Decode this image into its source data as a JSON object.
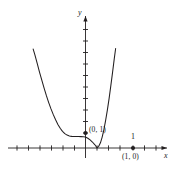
{
  "figure": {
    "kind": "cartesian-graph",
    "background": "#ffffff",
    "stroke_color": "#231f20",
    "curve_color": "#231f20"
  },
  "axes": {
    "x_label": "x",
    "y_label": "y",
    "origin_px": [
      85.5,
      148
    ],
    "x_axis_y_px": 148,
    "y_axis_x_px": 85.5,
    "tick_spacing_px": 11.5,
    "x_ticks_left": 7,
    "x_ticks_right": 7,
    "y_ticks_up": 11,
    "y_ticks_down": 1,
    "arrow_ends": [
      "x-right",
      "y-top"
    ]
  },
  "labels": {
    "point_0_1": "(0, 1)",
    "point_1_0": "(1, 0)",
    "tick_one": "1"
  },
  "points": [
    {
      "name": "y-intercept",
      "label": "(0, 1)",
      "x": 0,
      "y": 1,
      "px": [
        85.5,
        133
      ],
      "marker": "filled-dot"
    },
    {
      "name": "x-intercept",
      "label": "(1, 0)",
      "x": 1,
      "y": 0,
      "px": [
        133,
        148
      ],
      "marker": "filled-dot"
    }
  ],
  "chart_data": {
    "type": "line",
    "title": "",
    "xlabel": "x",
    "ylabel": "y",
    "grid": false,
    "legend": null,
    "xlim": [
      -4.4,
      7.7
    ],
    "ylim": [
      -1.0,
      8.7
    ],
    "annotations": [
      {
        "text": "(0, 1)",
        "x": 0,
        "y": 1
      },
      {
        "text": "(1, 0)",
        "x": 1,
        "y": 0
      },
      {
        "text": "1",
        "x": 1,
        "y": 1.0
      }
    ],
    "series": [
      {
        "name": "curve",
        "x": [
          -4.55,
          -4.4,
          -4.2,
          -4.0,
          -3.8,
          -3.6,
          -3.4,
          -3.2,
          -3.0,
          -2.8,
          -2.6,
          -2.4,
          -2.2,
          -2.0,
          -1.8,
          -1.6,
          -1.4,
          -1.2,
          -1.0,
          -0.8,
          -0.6,
          -0.4,
          -0.2,
          0.0,
          0.2,
          0.4,
          0.6,
          0.8,
          1.0,
          1.15,
          1.3,
          1.45,
          1.6,
          1.75,
          1.9,
          2.05,
          2.2,
          2.35,
          2.5,
          2.62
        ],
        "y": [
          8.6,
          8.1,
          7.35,
          6.6,
          5.9,
          5.2,
          4.55,
          3.95,
          3.4,
          2.9,
          2.45,
          2.05,
          1.72,
          1.45,
          1.25,
          1.12,
          1.05,
          1.01,
          1.0,
          1.0,
          1.0,
          0.99,
          0.97,
          0.95,
          0.85,
          0.7,
          0.52,
          0.3,
          0.02,
          0.15,
          0.45,
          0.95,
          1.6,
          2.4,
          3.3,
          4.3,
          5.4,
          6.55,
          7.75,
          8.65
        ]
      }
    ]
  }
}
